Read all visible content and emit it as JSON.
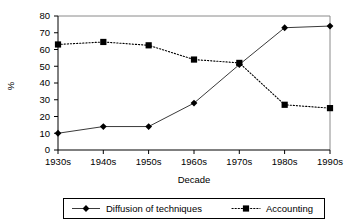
{
  "chart_data": {
    "type": "line",
    "title": "",
    "xlabel": "Decade",
    "ylabel": "%",
    "categories": [
      "1930s",
      "1940s",
      "1950s",
      "1960s",
      "1970s",
      "1980s",
      "1990s"
    ],
    "ylim": [
      0,
      80
    ],
    "yticks": [
      0,
      10,
      20,
      30,
      40,
      50,
      60,
      70,
      80
    ],
    "grid": false,
    "legend_position": "bottom",
    "series": [
      {
        "name": "Diffusion of techniques",
        "marker": "diamond",
        "linestyle": "solid",
        "color": "#000000",
        "values": [
          10,
          14,
          14,
          28,
          51,
          73,
          74
        ]
      },
      {
        "name": "Accounting",
        "marker": "square",
        "linestyle": "dotted",
        "color": "#000000",
        "values": [
          63,
          64.5,
          62.5,
          54,
          52,
          27,
          25
        ]
      }
    ]
  },
  "axis": {
    "y_title": "%",
    "x_title": "Decade"
  },
  "legend": {
    "entries": [
      {
        "label": "Diffusion of techniques",
        "marker": "diamond-marker",
        "line": "solid-line"
      },
      {
        "label": "Accounting",
        "marker": "square-marker",
        "line": "dotted-line"
      }
    ]
  },
  "ytick_labels": [
    "0",
    "10",
    "20",
    "30",
    "40",
    "50",
    "60",
    "70",
    "80"
  ],
  "xtick_labels": [
    "1930s",
    "1940s",
    "1950s",
    "1960s",
    "1970s",
    "1980s",
    "1990s"
  ]
}
